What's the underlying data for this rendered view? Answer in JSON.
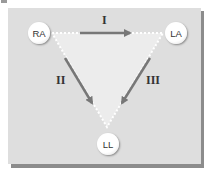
{
  "diagram": {
    "nodes": [
      {
        "id": "RA",
        "label": "RA"
      },
      {
        "id": "LA",
        "label": "LA"
      },
      {
        "id": "LL",
        "label": "LL"
      }
    ],
    "leads": [
      {
        "label": "I",
        "from": "RA",
        "to": "LA"
      },
      {
        "label": "II",
        "from": "RA",
        "to": "LL"
      },
      {
        "label": "III",
        "from": "LA",
        "to": "LL"
      }
    ],
    "colors": {
      "panel": "#dedede",
      "triangle": "#ececec",
      "arrow": "#777777",
      "dots": "#ffffff"
    }
  }
}
